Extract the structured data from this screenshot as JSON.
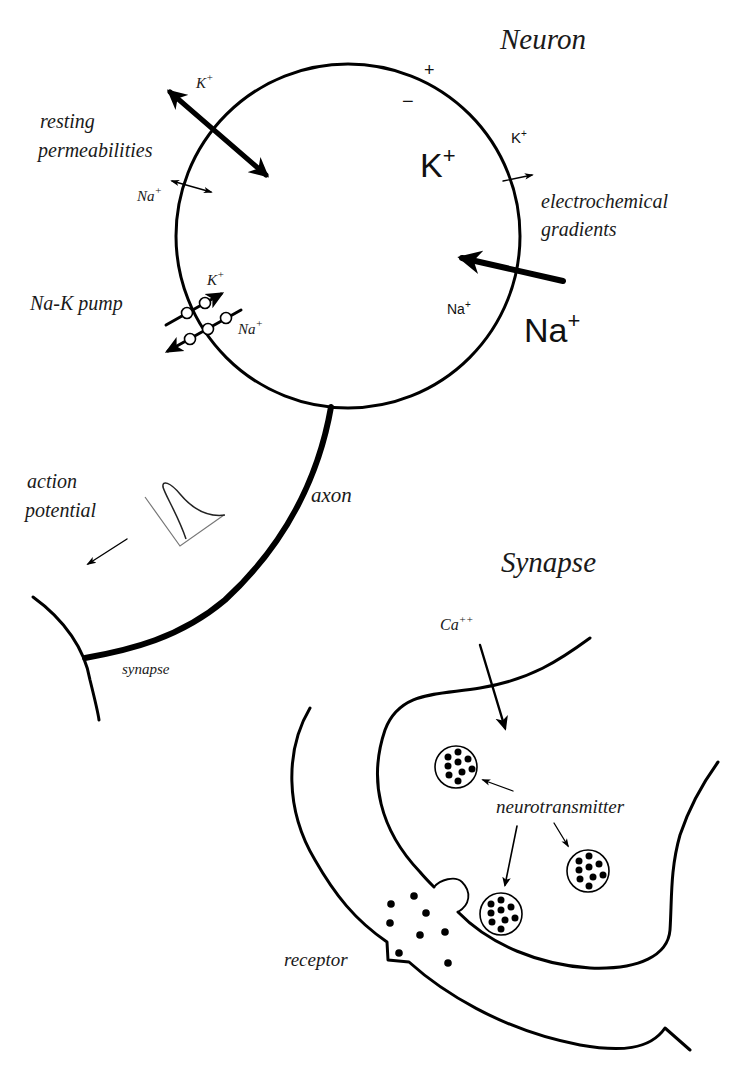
{
  "neuron": {
    "title": "Neuron",
    "charge_outside": "+",
    "charge_inside": "−",
    "resting_permeabilities": {
      "label_line1": "resting",
      "label_line2": "permeabilities",
      "k_label": "K",
      "na_label": "Na",
      "sup": "+"
    },
    "electrochemical_gradients": {
      "label_line1": "electrochemical",
      "label_line2": "gradients",
      "k_inside": "K",
      "k_outside": "K",
      "na_inside": "Na",
      "na_outside": "Na",
      "sup": "+"
    },
    "na_k_pump": {
      "label": "Na-K pump",
      "k_label": "K",
      "na_label": "Na",
      "sup": "+"
    },
    "action_potential": {
      "label_line1": "action",
      "label_line2": "potential"
    },
    "axon_label": "axon",
    "synapse_label": "synapse"
  },
  "synapse": {
    "title": "Synapse",
    "calcium_label": "Ca",
    "calcium_sup": "++",
    "neurotransmitter_label": "neurotransmitter",
    "receptor_label": "receptor"
  },
  "colors": {
    "line": "#000000",
    "text": "#1a1a1a",
    "background": "#ffffff",
    "trace": "#777777"
  }
}
